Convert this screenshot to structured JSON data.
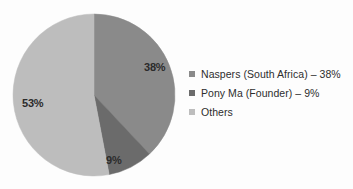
{
  "chart_data": {
    "type": "pie",
    "title": "",
    "categories": [
      "Naspers (South Africa)",
      "Pony Ma (Founder)",
      "Others"
    ],
    "values": [
      38,
      9,
      53
    ],
    "unit": "%",
    "slice_labels": [
      "38%",
      "9%",
      "53%"
    ],
    "legend": {
      "position": "right",
      "entries": [
        {
          "label": "Naspers (South Africa) – 38%",
          "color": "#8a8a8a"
        },
        {
          "label": "Pony Ma (Founder) – 9%",
          "color": "#6b6b6b"
        },
        {
          "label": "Others",
          "color": "#bdbdbd"
        }
      ]
    },
    "colors": [
      "#8a8a8a",
      "#6b6b6b",
      "#bdbdbd"
    ],
    "start_angle_deg": 0,
    "direction": "clockwise",
    "grid": false,
    "xlabel": "",
    "ylabel": ""
  },
  "geometry": {
    "center_x": 94,
    "center_y": 95,
    "radius": 81
  },
  "background_color": "#fdfdfd"
}
